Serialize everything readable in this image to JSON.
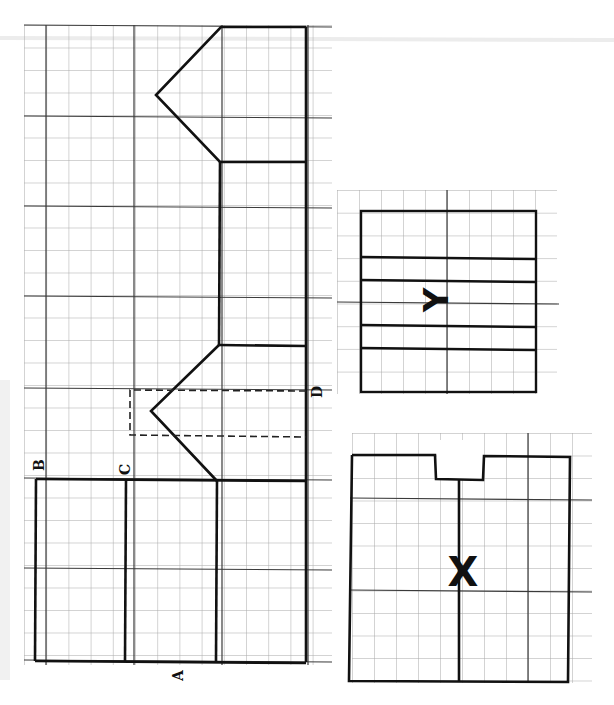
{
  "diagram": {
    "colors": {
      "outline": "#111111",
      "grid": "#9a9a9a",
      "grid_major": "#444444",
      "paper": "#ffffff"
    },
    "labels": {
      "A": "A",
      "B": "B",
      "C": "C",
      "D": "D",
      "X": "X",
      "Y": "Y"
    },
    "pieces": [
      {
        "id": "main",
        "description": "Large pattern piece with two pointed (chevron) cut-outs and dashed fold area marked D; bottom section split by lines B and C; label A at bottom"
      },
      {
        "id": "Y",
        "description": "Rectangle piece with four horizontal lines, marked Y (rotated)"
      },
      {
        "id": "X",
        "description": "Rectangle piece with a notch at top and central vertical line, marked X"
      }
    ]
  }
}
